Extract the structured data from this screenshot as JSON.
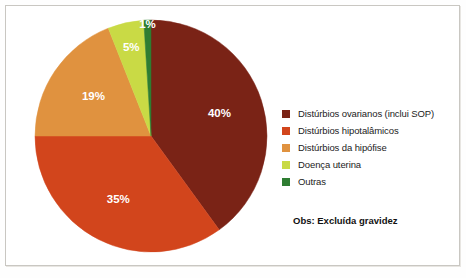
{
  "chart_data": {
    "type": "pie",
    "title": "",
    "subtitle": "",
    "xlabel": "",
    "ylabel": "",
    "legend_position": "right",
    "grid": false,
    "start_angle_deg": 0,
    "direction": "clockwise",
    "categories": [
      "Distúrbios ovarianos (inclui SOP)",
      "Distúrbios hipotalâmicos",
      "Distúrbios da hipófise",
      "Doença uterina",
      "Outras"
    ],
    "values": [
      40,
      35,
      19,
      5,
      1
    ],
    "value_labels": [
      "40%",
      "35%",
      "19%",
      "5%",
      "1%"
    ],
    "colors": [
      "#7A2316",
      "#D2451C",
      "#E0923F",
      "#C9DA45",
      "#2E7D32"
    ],
    "label_text_colors": [
      "#ffffff",
      "#ffffff",
      "#3a2a12",
      "#3a2a12",
      "#ffffff"
    ],
    "annotations": [
      "Obs: Excluída gravidez"
    ]
  },
  "legend": {
    "items": [
      {
        "label": "Distúrbios ovarianos (inclui SOP)",
        "color": "#7A2316"
      },
      {
        "label": "Distúrbios hipotalâmicos",
        "color": "#D2451C"
      },
      {
        "label": "Distúrbios da hipófise",
        "color": "#E0923F"
      },
      {
        "label": "Doença uterina",
        "color": "#C9DA45"
      },
      {
        "label": "Outras",
        "color": "#2E7D32"
      }
    ]
  },
  "note": {
    "text": "Obs: Excluída gravidez"
  }
}
